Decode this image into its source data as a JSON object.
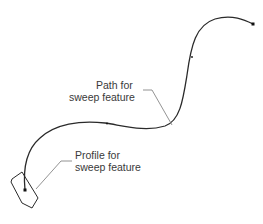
{
  "diagram": {
    "labels": {
      "path": {
        "line1": "Path for",
        "line2": "sweep feature"
      },
      "profile": {
        "line1": "Profile for",
        "line2": "sweep feature"
      }
    },
    "colors": {
      "background": "#ffffff",
      "curve": "#2a2a2a",
      "leader": "#777777",
      "text": "#3a3a3a"
    }
  }
}
